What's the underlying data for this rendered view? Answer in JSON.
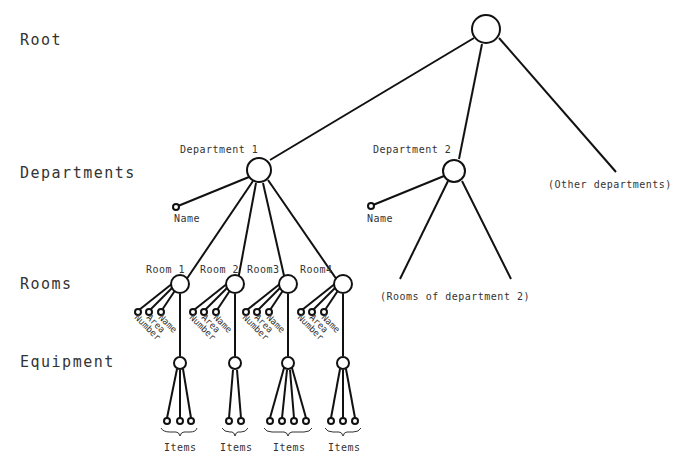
{
  "levels": {
    "root": "Root",
    "departments": "Departments",
    "rooms": "Rooms",
    "equipment": "Equipment"
  },
  "nodes": {
    "department1": "Department 1",
    "department2": "Department 2",
    "other_departments": "(Other departments)",
    "dept1_attr": "Name",
    "dept2_attr": "Name",
    "rooms_of_dept2": "(Rooms of department 2)"
  },
  "rooms": [
    {
      "label": "Room 1",
      "attrs": [
        "Number",
        "Area",
        "Name"
      ],
      "items_label": "Items",
      "item_count": 3
    },
    {
      "label": "Room 2",
      "attrs": [
        "Number",
        "Area",
        "Name"
      ],
      "items_label": "Items",
      "item_count": 2
    },
    {
      "label": "Room3",
      "attrs": [
        "Number",
        "Area",
        "Name"
      ],
      "items_label": "Items",
      "item_count": 4
    },
    {
      "label": "Room4",
      "attrs": [
        "Number",
        "Area",
        "Name"
      ],
      "items_label": "Items",
      "item_count": 3
    }
  ],
  "colors": {
    "line": "#111111",
    "text": "#333333",
    "background": "#ffffff"
  }
}
